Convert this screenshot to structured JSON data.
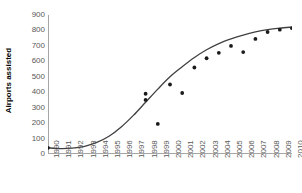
{
  "chart_data": {
    "type": "scatter",
    "title": "",
    "xlabel": "",
    "ylabel": "Airports assisted",
    "xlim": [
      1990,
      2010
    ],
    "ylim": [
      0,
      900
    ],
    "grid": false,
    "legend": "none",
    "y_ticks": [
      900,
      800,
      700,
      600,
      500,
      400,
      300,
      200,
      100,
      0
    ],
    "x_ticks": [
      1990,
      1991,
      1992,
      1993,
      1994,
      1995,
      1996,
      1997,
      1998,
      1999,
      2000,
      2001,
      2002,
      2003,
      2004,
      2005,
      2006,
      2007,
      2008,
      2009,
      2010
    ],
    "series": [
      {
        "name": "Airports assisted",
        "type": "scatter",
        "marker": "circle",
        "color": "#1a1a1a",
        "points": [
          {
            "x": 1990,
            "y": 40
          },
          {
            "x": 1998,
            "y": 350
          },
          {
            "x": 1998,
            "y": 390
          },
          {
            "x": 1999,
            "y": 195
          },
          {
            "x": 2000,
            "y": 450
          },
          {
            "x": 2001,
            "y": 395
          },
          {
            "x": 2002,
            "y": 560
          },
          {
            "x": 2003,
            "y": 620
          },
          {
            "x": 2004,
            "y": 655
          },
          {
            "x": 2005,
            "y": 700
          },
          {
            "x": 2006,
            "y": 660
          },
          {
            "x": 2007,
            "y": 745
          },
          {
            "x": 2008,
            "y": 790
          },
          {
            "x": 2009,
            "y": 805
          },
          {
            "x": 2010,
            "y": 815
          }
        ]
      },
      {
        "name": "Fitted trend",
        "type": "line",
        "color": "#404040",
        "points": [
          {
            "x": 1990,
            "y": 40
          },
          {
            "x": 1991,
            "y": 35
          },
          {
            "x": 1992,
            "y": 38
          },
          {
            "x": 1993,
            "y": 50
          },
          {
            "x": 1994,
            "y": 75
          },
          {
            "x": 1995,
            "y": 115
          },
          {
            "x": 1996,
            "y": 175
          },
          {
            "x": 1997,
            "y": 250
          },
          {
            "x": 1998,
            "y": 335
          },
          {
            "x": 1999,
            "y": 420
          },
          {
            "x": 2000,
            "y": 500
          },
          {
            "x": 2001,
            "y": 565
          },
          {
            "x": 2002,
            "y": 625
          },
          {
            "x": 2003,
            "y": 675
          },
          {
            "x": 2004,
            "y": 715
          },
          {
            "x": 2005,
            "y": 745
          },
          {
            "x": 2006,
            "y": 770
          },
          {
            "x": 2007,
            "y": 790
          },
          {
            "x": 2008,
            "y": 805
          },
          {
            "x": 2009,
            "y": 815
          },
          {
            "x": 2010,
            "y": 822
          }
        ]
      }
    ]
  },
  "axis": {
    "y_title": "Airports assisted"
  }
}
